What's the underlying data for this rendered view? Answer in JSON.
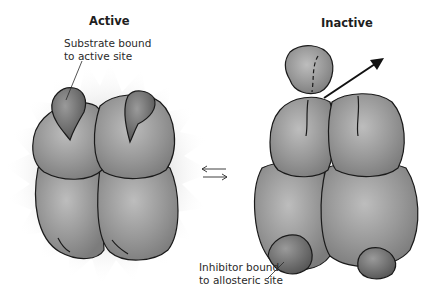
{
  "diagram": {
    "type": "allosteric-regulation",
    "states": [
      {
        "id": "active",
        "title": "Active",
        "annotation": [
          "Substrate bound",
          "to active site"
        ]
      },
      {
        "id": "inactive",
        "title": "Inactive",
        "annotation": [
          "Inhibitor bound",
          "to allosteric site"
        ]
      }
    ],
    "equilibrium_symbol": "reversible-arrows",
    "colors": {
      "enzyme_fill": "#8e8e8e",
      "enzyme_highlight": "#b9b9b9",
      "outline": "#1a1a1a",
      "inhibitor_fill": "#6a6a6a",
      "glow": "#e8e8e8",
      "background": "#ffffff"
    }
  }
}
